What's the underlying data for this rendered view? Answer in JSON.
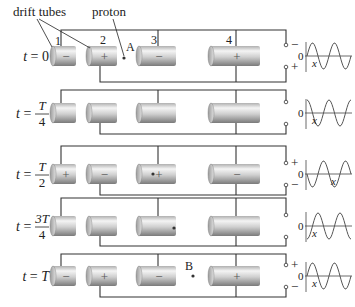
{
  "labels": {
    "drift_tubes": "drift tubes",
    "proton": "proton",
    "point_a": "A",
    "point_b": "B",
    "tube_numbers": [
      "1",
      "2",
      "3",
      "4"
    ],
    "axis_zero": "0",
    "axis_x": "x"
  },
  "rows": [
    {
      "time_label": "t = 0",
      "t_num": "",
      "t_den": "",
      "t_plain": "0",
      "charges": [
        "−",
        "+",
        "−",
        "+"
      ],
      "terminals": [
        "−",
        "+"
      ],
      "proton_position": "between tubes 2 and 3 (A)",
      "phase": 0
    },
    {
      "time_label": "t = T/4",
      "t_num": "T",
      "t_den": "4",
      "t_plain": "",
      "charges": [
        "",
        "",
        "",
        ""
      ],
      "terminals": [
        "",
        ""
      ],
      "proton_position": "inside tube 3",
      "phase": 90
    },
    {
      "time_label": "t = T/2",
      "t_num": "T",
      "t_den": "2",
      "t_plain": "",
      "charges": [
        "+",
        "−",
        "+",
        "−"
      ],
      "terminals": [
        "+",
        "−"
      ],
      "proton_position": "inside tube 3",
      "phase": 180
    },
    {
      "time_label": "t = 3T/4",
      "t_num": "3T",
      "t_den": "4",
      "t_plain": "",
      "charges": [
        "",
        "",
        "",
        ""
      ],
      "terminals": [
        "",
        ""
      ],
      "proton_position": "exit of tube 3",
      "phase": 270
    },
    {
      "time_label": "t = T",
      "t_num": "",
      "t_den": "",
      "t_plain": "T",
      "charges": [
        "−",
        "+",
        "−",
        "+"
      ],
      "terminals": [
        "+",
        "−"
      ],
      "proton_position": "between tubes 3 and 4 (B)",
      "phase": 360
    }
  ],
  "colors": {
    "wire": "#333333",
    "tube_light": "#f2f2f2",
    "tube_dark": "#8a8a8a",
    "text": "#222222"
  }
}
